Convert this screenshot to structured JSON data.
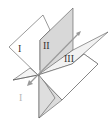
{
  "diagram": {
    "colors": {
      "stroke": "#555555",
      "plane_I_fill": "#ffffff",
      "plane_II_fill": "#dcdcdc",
      "plane_III_fill": "#f2f2f2",
      "arrow": "#9a9a9a",
      "faint_label": "#b8b8b8"
    },
    "labels": {
      "plane_I": "I",
      "plane_II": "II",
      "plane_III": "III",
      "axis_I": "I"
    },
    "intersection_point": [
      38,
      75
    ]
  }
}
